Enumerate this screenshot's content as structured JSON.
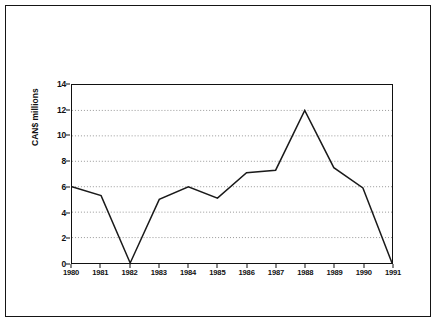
{
  "chart_data": {
    "type": "line",
    "title": "",
    "xlabel": "",
    "ylabel": "CAN$ millions",
    "categories": [
      "1980",
      "1981",
      "1982",
      "1983",
      "1984",
      "1985",
      "1986",
      "1987",
      "1988",
      "1989",
      "1990",
      "1991"
    ],
    "values": [
      6.0,
      5.3,
      0.0,
      5.0,
      6.0,
      5.1,
      7.1,
      7.3,
      12.0,
      7.5,
      5.9,
      0.0
    ],
    "ylim": [
      0,
      14
    ],
    "yticks": [
      0,
      2,
      4,
      6,
      8,
      10,
      12,
      14
    ],
    "ytick_labels": [
      "0",
      "2",
      "4",
      "6",
      "8",
      "10",
      "12",
      "14"
    ],
    "grid": "horizontal-dotted",
    "legend": "none",
    "series_color": "#1a1a1a",
    "grid_color": "#8c8c8c",
    "frame_color": "#151515",
    "background": "#ffffff"
  }
}
